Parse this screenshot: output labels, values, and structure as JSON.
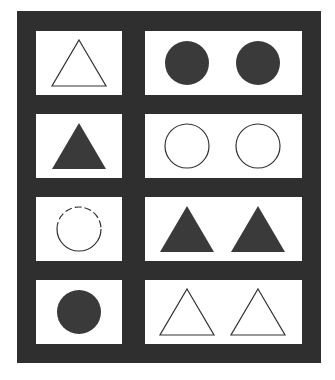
{
  "title": "",
  "colors": {
    "frame": "#2f2f2f",
    "cell": "#ffffff",
    "fill": "#3a3a3a",
    "stroke": "#333333"
  },
  "rows": [
    {
      "left": [
        {
          "shape": "triangle",
          "style": "outline"
        }
      ],
      "right": [
        {
          "shape": "circle",
          "style": "filled"
        },
        {
          "shape": "circle",
          "style": "filled"
        }
      ]
    },
    {
      "left": [
        {
          "shape": "triangle",
          "style": "filled"
        }
      ],
      "right": [
        {
          "shape": "circle",
          "style": "outline"
        },
        {
          "shape": "circle",
          "style": "outline"
        }
      ]
    },
    {
      "left": [
        {
          "shape": "circle",
          "style": "outline-dashed-top"
        }
      ],
      "right": [
        {
          "shape": "triangle",
          "style": "filled"
        },
        {
          "shape": "triangle",
          "style": "filled"
        }
      ]
    },
    {
      "left": [
        {
          "shape": "circle",
          "style": "filled"
        }
      ],
      "right": [
        {
          "shape": "triangle",
          "style": "outline"
        },
        {
          "shape": "triangle",
          "style": "outline"
        }
      ]
    }
  ]
}
